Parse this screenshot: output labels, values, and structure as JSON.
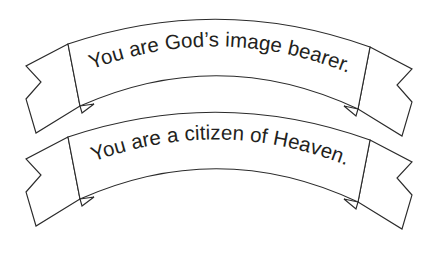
{
  "figure": {
    "background_color": "#ffffff",
    "stroke_color": "#2b2b2b",
    "text_color": "#231f20",
    "style": "line-art outline, no fill"
  },
  "banners": [
    {
      "id": "banner-1",
      "text": "You are God’s image bearer.",
      "position": "top"
    },
    {
      "id": "banner-2",
      "text": "You are a citizen of Heaven.",
      "position": "bottom"
    }
  ]
}
